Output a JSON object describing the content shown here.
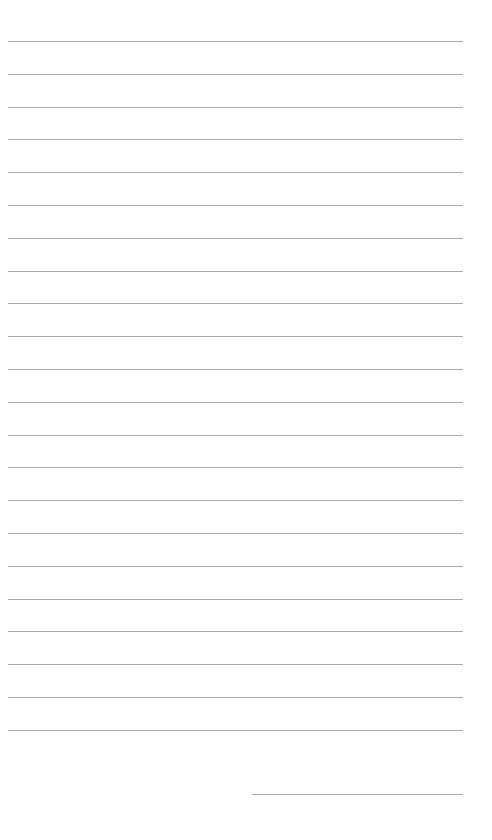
{
  "document": {
    "type": "lined-paper",
    "line_color": "#a9a9a9",
    "background_color": "#ffffff",
    "ruled_lines": {
      "count": 22,
      "first_y": 41,
      "spacing": 32.8,
      "left": 8,
      "right": 463
    },
    "signature_line": {
      "y": 794,
      "left": 252,
      "right": 463
    }
  }
}
